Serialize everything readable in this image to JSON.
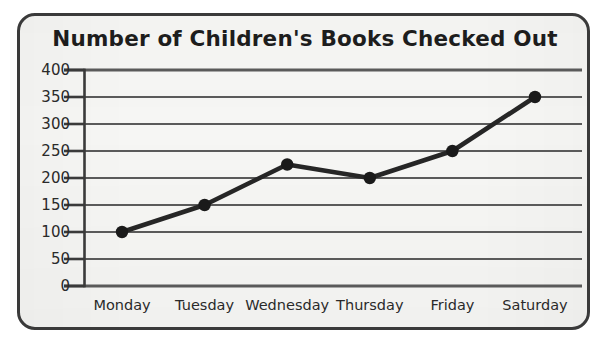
{
  "chart_data": {
    "type": "line",
    "title": "Number of Children's Books Checked Out",
    "xlabel": "",
    "ylabel": "",
    "categories": [
      "Monday",
      "Tuesday",
      "Wednesday",
      "Thursday",
      "Friday",
      "Saturday"
    ],
    "values": [
      100,
      150,
      225,
      200,
      250,
      350
    ],
    "series": [
      {
        "name": "Books Checked Out",
        "values": [
          100,
          150,
          225,
          200,
          250,
          350
        ]
      }
    ],
    "ylim": [
      0,
      400
    ],
    "ytick_labels": [
      "400",
      "350",
      "300",
      "250",
      "200",
      "150",
      "100",
      "50",
      "0"
    ],
    "ytick_values": [
      400,
      350,
      300,
      250,
      200,
      150,
      100,
      50,
      0
    ],
    "grid": true,
    "legend": false,
    "legend_position": "none",
    "marker": "circle",
    "colors": {
      "line": "#262626",
      "marker": "#1a1a1a",
      "grid": "#5a5a5a",
      "axis": "#3a3a3a",
      "background": "#f6f6f4",
      "frame_border": "#3a3a3a",
      "text": "#1d1d1d"
    }
  }
}
